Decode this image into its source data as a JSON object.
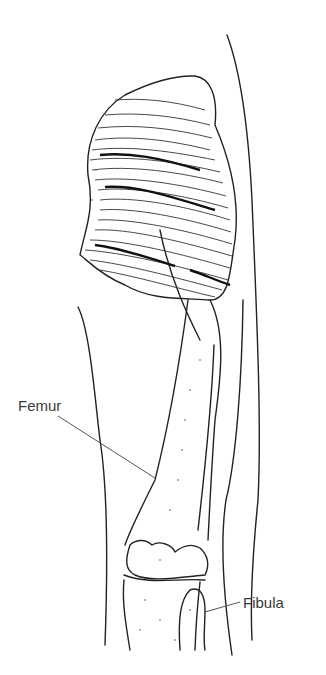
{
  "figure": {
    "type": "anatomical illustration",
    "labels": [
      {
        "id": "femur",
        "text": "Femur"
      },
      {
        "id": "fibula",
        "text": "Fibula"
      }
    ]
  },
  "colors": {
    "background": "#ffffff",
    "line": "#222222",
    "label": "#3a3a3a"
  }
}
